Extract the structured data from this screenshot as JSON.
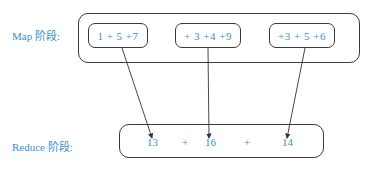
{
  "diagram": {
    "map_label": "Map 阶段:",
    "reduce_label": "Reduce 阶段:",
    "map_boxes": [
      {
        "expression": "1 + 5 +7"
      },
      {
        "expression": "+ 3 +4 +9"
      },
      {
        "expression": "+3 + 5 +6"
      }
    ],
    "reduce_terms": [
      "13",
      "+",
      "16",
      "+",
      "14"
    ],
    "colors": {
      "text": "#3a8fcf",
      "stroke": "#3a3a3a"
    }
  }
}
